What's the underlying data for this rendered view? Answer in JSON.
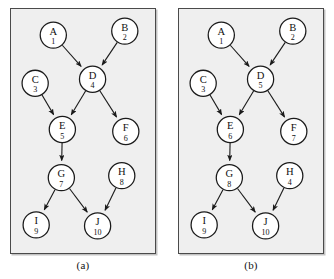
{
  "figure": {
    "panels": [
      {
        "caption": "(a)",
        "nodes": [
          {
            "id": "A",
            "letter": "A",
            "number": "1",
            "x": 42,
            "y": 26
          },
          {
            "id": "B",
            "letter": "B",
            "number": "2",
            "x": 113,
            "y": 22
          },
          {
            "id": "C",
            "letter": "C",
            "number": "3",
            "x": 24,
            "y": 74
          },
          {
            "id": "D",
            "letter": "D",
            "number": "4",
            "x": 81,
            "y": 70
          },
          {
            "id": "E",
            "letter": "E",
            "number": "5",
            "x": 51,
            "y": 120
          },
          {
            "id": "F",
            "letter": "F",
            "number": "6",
            "x": 114,
            "y": 122
          },
          {
            "id": "G",
            "letter": "G",
            "number": "7",
            "x": 50,
            "y": 168
          },
          {
            "id": "H",
            "letter": "H",
            "number": "8",
            "x": 110,
            "y": 166
          },
          {
            "id": "I",
            "letter": "I",
            "number": "9",
            "x": 25,
            "y": 215
          },
          {
            "id": "J",
            "letter": "J",
            "number": "10",
            "x": 86,
            "y": 216
          }
        ],
        "edges": [
          {
            "from": "A",
            "to": "D"
          },
          {
            "from": "B",
            "to": "D"
          },
          {
            "from": "C",
            "to": "E"
          },
          {
            "from": "D",
            "to": "E"
          },
          {
            "from": "D",
            "to": "F"
          },
          {
            "from": "E",
            "to": "G"
          },
          {
            "from": "G",
            "to": "I"
          },
          {
            "from": "G",
            "to": "J"
          },
          {
            "from": "H",
            "to": "J"
          }
        ]
      },
      {
        "caption": "(b)",
        "nodes": [
          {
            "id": "A",
            "letter": "A",
            "number": "1",
            "x": 42,
            "y": 26
          },
          {
            "id": "B",
            "letter": "B",
            "number": "2",
            "x": 113,
            "y": 22
          },
          {
            "id": "C",
            "letter": "C",
            "number": "3",
            "x": 24,
            "y": 74
          },
          {
            "id": "D",
            "letter": "D",
            "number": "5",
            "x": 81,
            "y": 70
          },
          {
            "id": "E",
            "letter": "E",
            "number": "6",
            "x": 51,
            "y": 120
          },
          {
            "id": "F",
            "letter": "F",
            "number": "7",
            "x": 114,
            "y": 122
          },
          {
            "id": "G",
            "letter": "G",
            "number": "8",
            "x": 50,
            "y": 168
          },
          {
            "id": "H",
            "letter": "H",
            "number": "4",
            "x": 110,
            "y": 166
          },
          {
            "id": "I",
            "letter": "I",
            "number": "9",
            "x": 25,
            "y": 215
          },
          {
            "id": "J",
            "letter": "J",
            "number": "10",
            "x": 86,
            "y": 216
          }
        ],
        "edges": [
          {
            "from": "A",
            "to": "D"
          },
          {
            "from": "B",
            "to": "D"
          },
          {
            "from": "C",
            "to": "E"
          },
          {
            "from": "D",
            "to": "E"
          },
          {
            "from": "D",
            "to": "F"
          },
          {
            "from": "E",
            "to": "G"
          },
          {
            "from": "G",
            "to": "I"
          },
          {
            "from": "G",
            "to": "J"
          },
          {
            "from": "H",
            "to": "J"
          }
        ]
      }
    ],
    "node_radius": 13,
    "colors": {
      "panel_background": "#efefef",
      "panel_border": "#4a4a4a",
      "node_fill": "#ffffff",
      "node_stroke": "#1a1a1a",
      "edge_stroke": "#1a1a1a",
      "text": "#111111"
    }
  }
}
